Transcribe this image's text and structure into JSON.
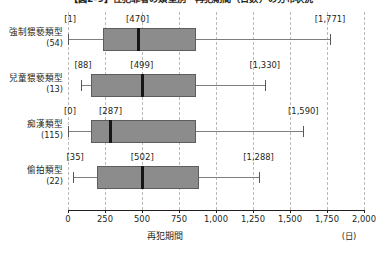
{
  "chart_data": {
    "type": "box",
    "title": "【図2-9】性犯罪者の類型別・再犯期間（日数）の分布状況",
    "xlabel": "再犯期間",
    "xunit": "(日)",
    "ylabel": "",
    "xlim": [
      0,
      2000
    ],
    "xticks": [
      0,
      250,
      500,
      750,
      1000,
      1250,
      1500,
      1750,
      2000
    ],
    "xticklabels": [
      "0",
      "250",
      "500",
      "750",
      "1,000",
      "1,250",
      "1,500",
      "1,750",
      "2,000"
    ],
    "grid": "vertical-dashed",
    "legend": "none",
    "categories": [
      {
        "label": "強制猥褻類型",
        "count": "(54)",
        "n": 54
      },
      {
        "label": "兒童猥褻類型",
        "count": "(13)",
        "n": 13
      },
      {
        "label": "痴漢類型",
        "count": "(115)",
        "n": 115
      },
      {
        "label": "偷拍類型",
        "count": "(22)",
        "n": 22
      }
    ],
    "boxes": [
      {
        "category": "強制猥褻類型",
        "min": 1,
        "q1": 237,
        "median": 470,
        "q3": 866,
        "max": 1771,
        "min_label": "[1]",
        "median_label": "[470]",
        "max_label": "[1,771]"
      },
      {
        "category": "兒童猥褻類型",
        "min": 88,
        "q1": 155,
        "median": 499,
        "q3": 866,
        "max": 1330,
        "min_label": "[88]",
        "median_label": "[499]",
        "max_label": "[1,330]"
      },
      {
        "category": "痴漢類型",
        "min": 0,
        "q1": 155,
        "median": 287,
        "q3": 866,
        "max": 1590,
        "min_label": "[0]",
        "median_label": "[287]",
        "max_label": "[1,590]"
      },
      {
        "category": "偷拍類型",
        "min": 35,
        "q1": 196,
        "median": 502,
        "q3": 887,
        "max": 1288,
        "min_label": "[35]",
        "median_label": "[502]",
        "max_label": "[1,288]"
      }
    ],
    "colors": {
      "box_fill": "#8c8c8c",
      "box_edge": "#5d5d5d",
      "median": "#161616",
      "whisker": "#7e7e7e",
      "grid": "#b9b9b9",
      "axis": "#231f20",
      "background": "#ffffff"
    }
  }
}
